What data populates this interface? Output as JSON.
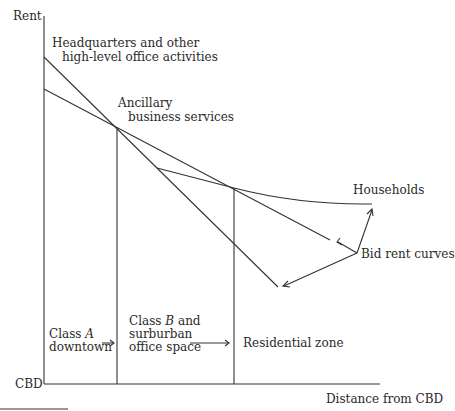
{
  "axes": {
    "y_label": "Rent",
    "origin_label": "CBD",
    "x_label": "Distance from CBD"
  },
  "curves": {
    "headquarters": "Headquarters and other",
    "headquarters_line2": "high-level office activities",
    "ancillary": "Ancillary",
    "ancillary_line2": "business services",
    "households": "Households",
    "bid_rent": "Bid rent curves"
  },
  "zones": {
    "class_a_line1": "Class",
    "class_a_letter": "A",
    "class_a_line2": "downtown",
    "class_b_line1": "Class",
    "class_b_letter": "B",
    "class_b_and": "and",
    "class_b_line2": "surburban",
    "class_b_line3": "office space",
    "residential": "Residential zone"
  },
  "colors": {
    "line": "#333333",
    "background": "#ffffff"
  }
}
